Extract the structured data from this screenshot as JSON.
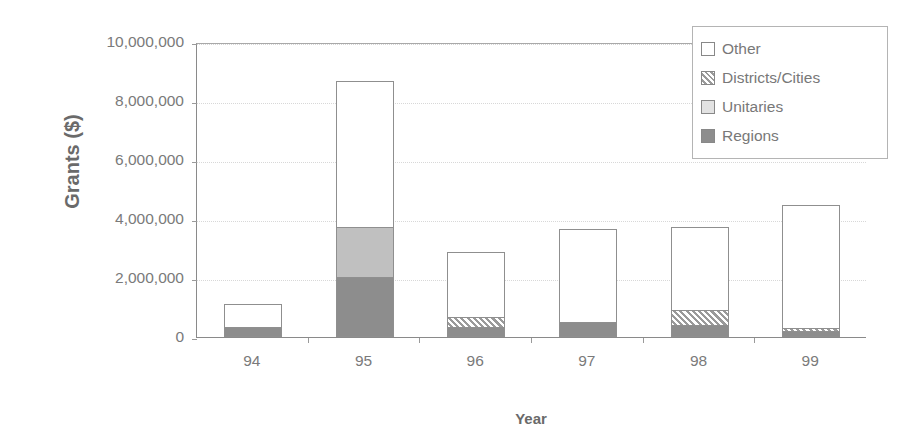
{
  "chart_data": {
    "type": "bar",
    "stacked": true,
    "title": "",
    "xlabel": "Year",
    "ylabel": "Grants ($)",
    "categories": [
      "94",
      "95",
      "96",
      "97",
      "98",
      "99"
    ],
    "ylim": [
      0,
      10000000
    ],
    "yticks": [
      0,
      2000000,
      4000000,
      6000000,
      8000000,
      10000000
    ],
    "ytick_labels": [
      "0",
      "2,000,000",
      "4,000,000",
      "6,000,000",
      "8,000,000",
      "10,000,000"
    ],
    "grid": true,
    "legend_position": "top-right",
    "stack_order_bottom_to_top": [
      "Regions",
      "Unitaries",
      "Districts/Cities",
      "Other"
    ],
    "series": [
      {
        "name": "Regions",
        "color": "#8d8d8d",
        "pattern": "solid-dark-gray",
        "values": [
          350000,
          2050000,
          350000,
          500000,
          400000,
          200000
        ]
      },
      {
        "name": "Unitaries",
        "color": "#c0c0c0",
        "pattern": "solid-light-gray",
        "values": [
          0,
          1700000,
          0,
          0,
          0,
          0
        ]
      },
      {
        "name": "Districts/Cities",
        "color": "#9a9a9a",
        "pattern": "diagonal-hatch",
        "values": [
          0,
          0,
          350000,
          0,
          550000,
          150000
        ]
      },
      {
        "name": "Other",
        "color": "#ffffff",
        "pattern": "solid-white",
        "values": [
          800000,
          5000000,
          2250000,
          3200000,
          2850000,
          4200000
        ]
      }
    ],
    "totals": [
      1150000,
      8750000,
      2950000,
      3700000,
      3800000,
      4550000
    ]
  },
  "legend": {
    "entries": [
      {
        "label": "Other",
        "swatch": "swatch-other-icon"
      },
      {
        "label": "Districts/Cities",
        "swatch": "swatch-districts-icon"
      },
      {
        "label": "Unitaries",
        "swatch": "swatch-unitaries-icon"
      },
      {
        "label": "Regions",
        "swatch": "swatch-regions-icon"
      }
    ]
  }
}
